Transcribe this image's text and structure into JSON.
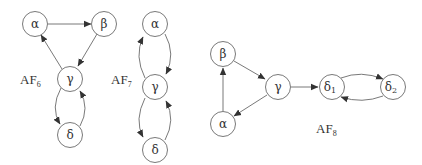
{
  "diagrams": [
    {
      "id": "AF6",
      "label": {
        "main": "AF",
        "sub": "6"
      },
      "nodes": [
        {
          "id": "a",
          "label": "α"
        },
        {
          "id": "b",
          "label": "β"
        },
        {
          "id": "g",
          "label": "γ"
        },
        {
          "id": "d",
          "label": "δ"
        }
      ],
      "edges": [
        [
          "α",
          "β"
        ],
        [
          "β",
          "γ"
        ],
        [
          "γ",
          "α"
        ],
        [
          "γ",
          "δ"
        ],
        [
          "δ",
          "γ"
        ]
      ]
    },
    {
      "id": "AF7",
      "label": {
        "main": "AF",
        "sub": "7"
      },
      "nodes": [
        {
          "id": "a",
          "label": "α"
        },
        {
          "id": "g",
          "label": "γ"
        },
        {
          "id": "d",
          "label": "δ"
        }
      ],
      "edges": [
        [
          "α",
          "γ"
        ],
        [
          "γ",
          "α"
        ],
        [
          "γ",
          "δ"
        ],
        [
          "δ",
          "γ"
        ]
      ]
    },
    {
      "id": "AF8",
      "label": {
        "main": "AF",
        "sub": "8"
      },
      "nodes": [
        {
          "id": "b",
          "label": "β"
        },
        {
          "id": "g",
          "label": "γ"
        },
        {
          "id": "a",
          "label": "α"
        },
        {
          "id": "d1",
          "label": "δ",
          "sub": "1"
        },
        {
          "id": "d2",
          "label": "δ",
          "sub": "2"
        }
      ],
      "edges": [
        [
          "α",
          "β"
        ],
        [
          "β",
          "γ"
        ],
        [
          "γ",
          "α"
        ],
        [
          "γ",
          "δ1"
        ],
        [
          "δ1",
          "δ2"
        ],
        [
          "δ2",
          "δ1"
        ]
      ]
    }
  ],
  "colors": {
    "stroke": "#6a6a6a",
    "text": "#333333",
    "background": "#ffffff"
  }
}
